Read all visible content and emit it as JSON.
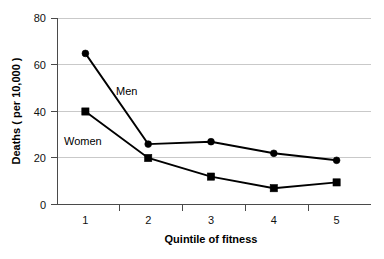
{
  "chart_data": {
    "type": "line",
    "title": "",
    "subtitle": "",
    "xlabel": "Quintile of fitness",
    "ylabel": "Deaths ( per 10,000 )",
    "categories": [
      "1",
      "2",
      "3",
      "4",
      "5"
    ],
    "x_tick_labels": [
      "1",
      "2",
      "3",
      "4",
      "5"
    ],
    "y_tick_labels": [
      "0",
      "20",
      "40",
      "60",
      "80"
    ],
    "y_tick_values": [
      0,
      20,
      40,
      60,
      80
    ],
    "ylim": [
      0,
      80
    ],
    "grid": "horizontal",
    "legend_position": "inline-annotations",
    "series": [
      {
        "name": "Men",
        "marker": "circle",
        "color": "#000000",
        "values": [
          65,
          26,
          27,
          22,
          19
        ],
        "annotation": {
          "text": "Men",
          "x_px": 116,
          "y_px": 91
        }
      },
      {
        "name": "Women",
        "marker": "square",
        "color": "#000000",
        "values": [
          40,
          20,
          12,
          7,
          9.5
        ],
        "annotation": {
          "text": "Women",
          "x_px": 64,
          "y_px": 141
        }
      }
    ],
    "annotations": [
      "Men",
      "Women"
    ]
  },
  "axes": {
    "x_axis_label": "Quintile of fitness",
    "y_axis_label": "Deaths ( per 10,000 )"
  },
  "colors": {
    "gridline": "#c9c9c9",
    "axis": "#4a4a4a",
    "series": "#000000",
    "background": "#ffffff"
  },
  "labels": {
    "y0": "0",
    "y20": "20",
    "y40": "40",
    "y60": "60",
    "y80": "80",
    "x1": "1",
    "x2": "2",
    "x3": "3",
    "x4": "4",
    "x5": "5",
    "men": "Men",
    "women": "Women"
  }
}
